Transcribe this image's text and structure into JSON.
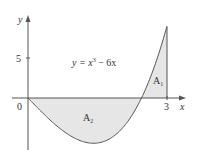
{
  "chart_data": {
    "type": "area",
    "title": "",
    "function": "y = x^3 - 6x",
    "equation_label": "y = x³ − 6x",
    "xlabel": "x",
    "ylabel": "y",
    "x_ticks": [
      {
        "value": 0,
        "label": "0"
      },
      {
        "value": 3,
        "label": "3"
      }
    ],
    "y_ticks": [
      {
        "value": 5,
        "label": "5"
      }
    ],
    "xlim": [
      -0.35,
      3.4
    ],
    "ylim": [
      -6.5,
      10
    ],
    "grid": false,
    "regions": [
      {
        "name": "A1",
        "label": "A₁",
        "x_range": [
          2.449,
          3
        ],
        "sign": "positive",
        "fill": "#e6e6e6"
      },
      {
        "name": "A2",
        "label": "A₂",
        "x_range": [
          0,
          2.449
        ],
        "sign": "negative",
        "fill": "#e6e6e6"
      }
    ],
    "key_points": [
      {
        "x": 0,
        "y": 0
      },
      {
        "x": 1.414,
        "y": -5.657,
        "note": "local minimum"
      },
      {
        "x": 2.449,
        "y": 0,
        "note": "root"
      },
      {
        "x": 3,
        "y": 9
      }
    ]
  },
  "labels": {
    "y_axis": "y",
    "x_axis": "x",
    "origin": "0",
    "x_tick_3": "3",
    "y_tick_5": "5",
    "equation": "y = x",
    "equation_exp": "3",
    "equation_rest": " − 6x",
    "region_a1": "A",
    "region_a1_sub": "1",
    "region_a2": "A",
    "region_a2_sub": "2"
  },
  "colors": {
    "axis": "#555555",
    "curve": "#555555",
    "fill": "#e6e6e6"
  }
}
